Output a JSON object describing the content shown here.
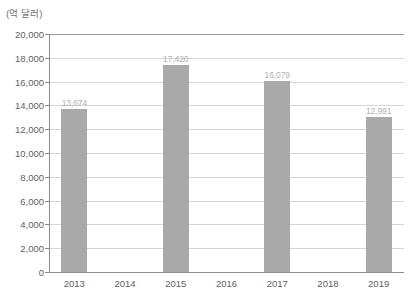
{
  "chart_data": {
    "type": "bar",
    "title": "",
    "subtitle": "",
    "unit_label": "(억 달러)",
    "xlabel": "",
    "ylabel": "",
    "categories": [
      "2013",
      "2014",
      "2015",
      "2016",
      "2017",
      "2018",
      "2019"
    ],
    "values": [
      13674,
      null,
      17420,
      null,
      16079,
      null,
      12991
    ],
    "value_labels": [
      "13,674",
      "",
      "17,420",
      "",
      "16,079",
      "",
      "12,991"
    ],
    "ylim": [
      0,
      20000
    ],
    "ytick_step": 2000,
    "ytick_labels": [
      "20,000",
      "18,000",
      "16,000",
      "14,000",
      "12,000",
      "10,000",
      "8,000",
      "6,000",
      "4,000",
      "2,000",
      "0"
    ],
    "ytick_values": [
      20000,
      18000,
      16000,
      14000,
      12000,
      10000,
      8000,
      6000,
      4000,
      2000,
      0
    ],
    "grid": true,
    "legend": false,
    "legend_position": "none",
    "series": [
      {
        "name": "",
        "values": [
          13674,
          null,
          17420,
          null,
          16079,
          null,
          12991
        ]
      }
    ],
    "colors": {
      "bar_fill": "#a9a9a9",
      "gridline": "#d6d6d6",
      "axis": "#8c8c8c",
      "tick_text": "#5f5f5f",
      "value_label_text": "#b2b2b2",
      "background": "#ffffff"
    }
  }
}
